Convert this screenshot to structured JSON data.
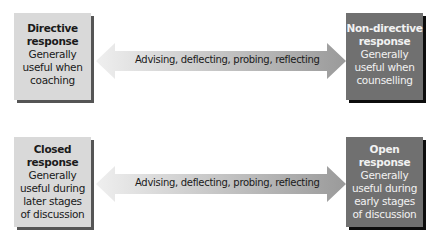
{
  "rows": [
    {
      "left_box": {
        "title_line1": "Directive",
        "title_line2": "response",
        "desc_lines": [
          "Generally",
          "useful when",
          "coaching"
        ],
        "style": "light"
      },
      "arrow_label": "Advising, deflecting, probing, reflecting",
      "right_box": {
        "title_line1": "Non-directive",
        "title_line2": "response",
        "desc_lines": [
          "Generally",
          "useful when",
          "counselling"
        ],
        "style": "dark"
      }
    },
    {
      "left_box": {
        "title_line1": "Closed",
        "title_line2": "response",
        "desc_lines": [
          "Generally",
          "useful during",
          "later stages",
          "of discussion"
        ],
        "style": "light"
      },
      "arrow_label": "Advising, deflecting, probing, reflecting",
      "right_box": {
        "title_line1": "Open",
        "title_line2": "response",
        "desc_lines": [
          "Generally",
          "useful during",
          "early stages",
          "of discussion"
        ],
        "style": "dark"
      }
    }
  ],
  "colors": {
    "light_box": "#d9d9d9",
    "dark_box": "#707070",
    "arrow_light_end": "#ececec",
    "arrow_dark_end": "#9a9a9a"
  }
}
